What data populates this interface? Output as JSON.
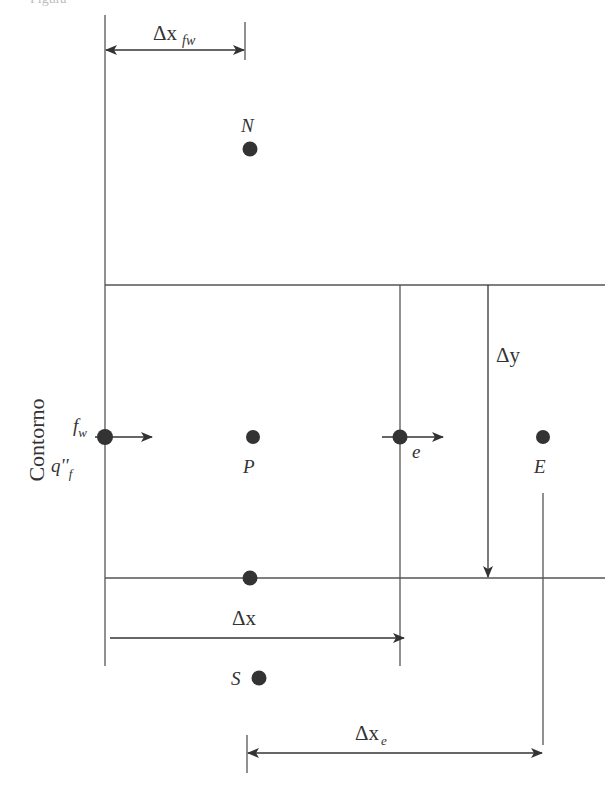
{
  "figure": {
    "type": "finite-volume grid cell at boundary (control volume diagram)",
    "caption_cropped": "Figura",
    "boundary_label": "Contorno",
    "nodes": [
      {
        "id": "N",
        "label": "N",
        "x": 250,
        "y": 149
      },
      {
        "id": "P",
        "label": "P",
        "x": 253,
        "y": 437
      },
      {
        "id": "E",
        "label": "E",
        "x": 543,
        "y": 437
      },
      {
        "id": "S",
        "label": "S",
        "x": 258,
        "y": 677
      },
      {
        "id": "fw",
        "label": "f",
        "sub": "w",
        "x": 105,
        "y": 437
      },
      {
        "id": "e",
        "label": "e",
        "x": 400,
        "y": 437
      },
      {
        "id": "south-face",
        "label": "",
        "x": 250,
        "y": 578
      }
    ],
    "flux_label": {
      "main": "q''",
      "sub": "f"
    },
    "dimensions": {
      "dx_fw": {
        "main": "Δx",
        "sub": "fw"
      },
      "dy": {
        "main": "Δy"
      },
      "dx": {
        "main": "Δx"
      },
      "dx_e": {
        "main": "Δx",
        "sub": "e"
      }
    },
    "colors": {
      "line": "#444444",
      "node": "#333333",
      "text": "#333333"
    }
  }
}
